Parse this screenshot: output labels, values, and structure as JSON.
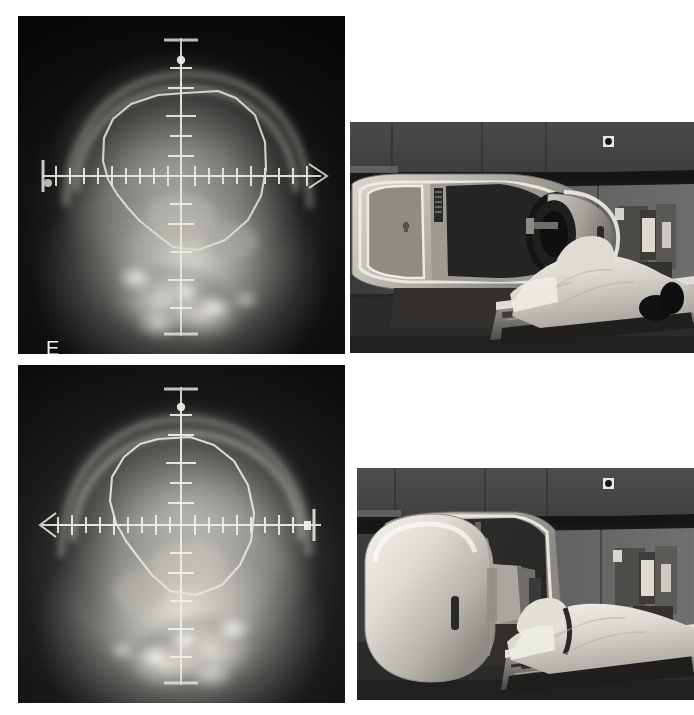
{
  "figure": {
    "caption_id": "figure-EH",
    "background_color": "#ffffff",
    "width": 694,
    "height": 715,
    "panel_label_color": "#f2f2f2"
  },
  "panels": [
    {
      "id": "E",
      "label": "E",
      "type": "simulator-radiograph",
      "description": "Lateral skull simulator radiograph with crosshair graticule and hand-drawn treatment field outline",
      "x": 18,
      "y": 16,
      "width": 327,
      "height": 338,
      "label_x": 10,
      "label_y": 306,
      "graticule": {
        "color": "#e8e8e0",
        "horizontal_arrow": "right",
        "horizontal_left_terminal": "bar",
        "horizontal_y_frac": 0.472,
        "vertical_x_frac": 0.5,
        "tick_spacing_px": 14,
        "tick_count_horizontal": 22,
        "tick_count_vertical": 11
      },
      "field_outline": {
        "color": "#dcdcd2",
        "style": "hand-drawn polygon",
        "closed": true
      },
      "image_tone": "dark",
      "flipped": false
    },
    {
      "id": "F",
      "label": "F",
      "type": "treatment-room-photograph",
      "description": "Linear accelerator with gantry in anterior position, patient supine on treatment couch with head at gantry bore",
      "x": 350,
      "y": 122,
      "width": 344,
      "height": 231,
      "label_x": 8,
      "label_y": 206,
      "scene": {
        "gantry_position": "anterior / 0 degrees",
        "patient_position": "supine, head-first",
        "visible_objects": [
          "gantry stand",
          "collimator head",
          "treatment couch",
          "patient",
          "wall console",
          "ceiling laser"
        ]
      }
    },
    {
      "id": "G",
      "label": "G",
      "type": "simulator-radiograph",
      "description": "Opposed lateral skull simulator radiograph with crosshair graticule and hand-drawn treatment field outline",
      "x": 18,
      "y": 365,
      "width": 327,
      "height": 338,
      "label_x": 10,
      "label_y": 306,
      "graticule": {
        "color": "#e8e8e0",
        "horizontal_arrow": "left",
        "horizontal_right_terminal": "bar-with-marker",
        "horizontal_y_frac": 0.472,
        "vertical_x_frac": 0.5,
        "tick_spacing_px": 14,
        "tick_count_horizontal": 22,
        "tick_count_vertical": 11
      },
      "field_outline": {
        "color": "#dcdcd2",
        "style": "hand-drawn polygon",
        "closed": true
      },
      "image_tone": "bright",
      "flipped": true
    },
    {
      "id": "H",
      "label": "H",
      "type": "treatment-room-photograph",
      "description": "Linear accelerator with gantry rotated to lateral position beside the patient on the treatment couch",
      "x": 357,
      "y": 468,
      "width": 337,
      "height": 232,
      "label_x": 4,
      "label_y": 208,
      "scene": {
        "gantry_position": "lateral / 90 degrees",
        "patient_position": "supine, head-first",
        "visible_objects": [
          "rotated gantry head",
          "gantry stand",
          "treatment couch",
          "patient",
          "wall console",
          "ceiling laser"
        ]
      }
    }
  ]
}
